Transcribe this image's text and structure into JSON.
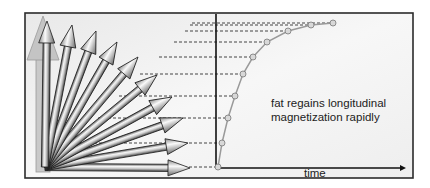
{
  "diagram": {
    "caption_line1": "fat regains longitudinal",
    "caption_line2": "magnetization rapidly",
    "x_axis_label": "time",
    "colors": {
      "frame": "#2b2b2b",
      "background": "#f2f2f2",
      "arrow_fill_light": "#f4f4f4",
      "arrow_fill_dark": "#7a7a7a",
      "arrow_stroke": "#1e1e1e",
      "curve": "#9a9a9a",
      "point_fill": "#d8d8d8",
      "dash": "#444444",
      "ghost_arrow": "#b5b5b5"
    },
    "origin": [
      45,
      167
    ],
    "arrow_tips": [
      [
        47,
        21
      ],
      [
        72,
        25
      ],
      [
        96,
        31
      ],
      [
        117,
        42
      ],
      [
        138,
        57
      ],
      [
        157,
        75
      ],
      [
        172,
        97
      ],
      [
        183,
        118
      ],
      [
        188,
        143
      ],
      [
        190,
        168
      ]
    ],
    "curve_points": [
      [
        218,
        167
      ],
      [
        222,
        143
      ],
      [
        228,
        118
      ],
      [
        235,
        96
      ],
      [
        243,
        74
      ],
      [
        253,
        57
      ],
      [
        267,
        42
      ],
      [
        288,
        31
      ],
      [
        311,
        25
      ],
      [
        333,
        23
      ]
    ]
  }
}
